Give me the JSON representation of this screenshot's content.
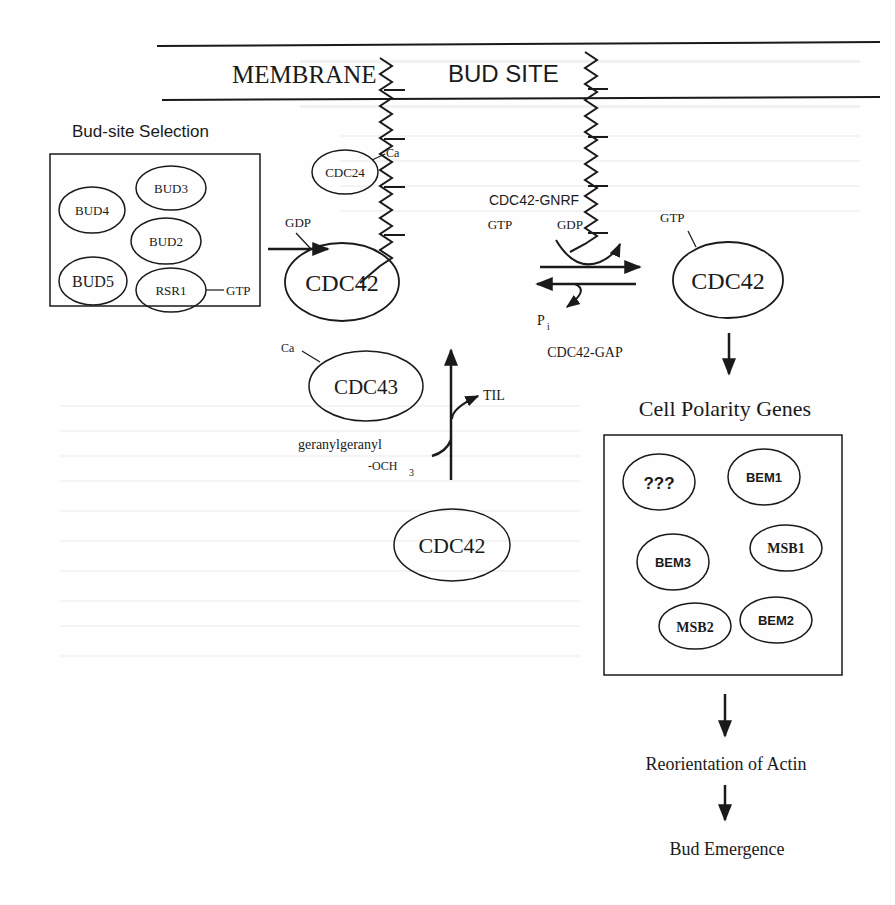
{
  "membrane": {
    "label_membrane": "MEMBRANE",
    "label_bud_site": "BUD SITE"
  },
  "bud_site_selection": {
    "title": "Bud-site Selection",
    "proteins": [
      "BUD4",
      "BUD3",
      "BUD2",
      "BUD5",
      "RSR1"
    ],
    "rsr1_bound": "GTP"
  },
  "cdc24": {
    "label": "CDC24",
    "modifier": "Ca"
  },
  "cdc42_gdp": {
    "label": "CDC42",
    "bound": "GDP"
  },
  "cdc42_gtp": {
    "label": "CDC42",
    "bound": "GTP"
  },
  "exchange": {
    "gef_label": "CDC42-GNRF",
    "in_label": "GTP",
    "out_label": "GDP",
    "gap_out_label": "P",
    "gap_out_sub": "i",
    "gap_label": "CDC42-GAP"
  },
  "prenylation": {
    "cdc43_label": "CDC43",
    "cdc43_modifier": "Ca",
    "til_label": "TIL",
    "input_label_1": "geranylgeranyl",
    "input_label_2": "-OCH",
    "input_label_2_sub": "3",
    "cdc42_label": "CDC42"
  },
  "cell_polarity": {
    "title": "Cell Polarity Genes",
    "proteins": [
      "???",
      "BEM1",
      "BEM3",
      "MSB1",
      "MSB2",
      "BEM2"
    ]
  },
  "downstream": {
    "step1": "Reorientation of Actin",
    "step2": "Bud Emergence"
  }
}
